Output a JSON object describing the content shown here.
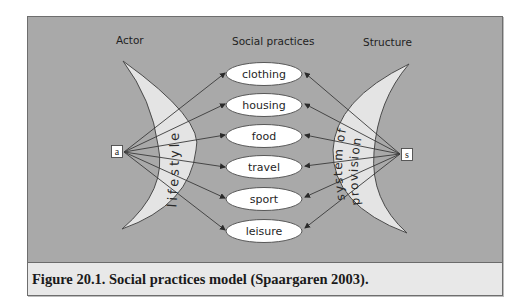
{
  "figure": {
    "headers": {
      "actor": "Actor",
      "social_practices": "Social practices",
      "structure": "Structure"
    },
    "actor_node": {
      "label": "a"
    },
    "structure_node": {
      "label": "s"
    },
    "left_crescent": {
      "label": "lifestyle"
    },
    "right_crescent": {
      "line1": "system of",
      "line2": "provision"
    },
    "practices": [
      "clothing",
      "housing",
      "food",
      "travel",
      "sport",
      "leisure"
    ],
    "caption": "Figure 20.1. Social practices model (Spaargaren 2003).",
    "colors": {
      "background": "#a9a9a9",
      "crescent_fill": "#e4e4e4",
      "oval_fill": "#ffffff",
      "caption_band": "#e8e8e8",
      "stroke": "#4a4a4a"
    }
  }
}
